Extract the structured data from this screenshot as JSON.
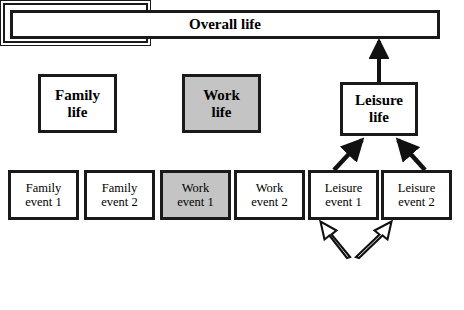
{
  "diagram": {
    "title_box": {
      "label": "Overall life"
    },
    "domains": [
      {
        "name": "family-life",
        "line1": "Family",
        "line2": "life",
        "shaded": false
      },
      {
        "name": "work-life",
        "line1": "Work",
        "line2": "life",
        "shaded": true
      },
      {
        "name": "leisure-life",
        "line1": "Leisure",
        "line2": "life",
        "shaded": false
      }
    ],
    "events": [
      {
        "name": "family-event-1",
        "line1": "Family",
        "line2": "event 1",
        "shaded": false
      },
      {
        "name": "family-event-2",
        "line1": "Family",
        "line2": "event 2",
        "shaded": false
      },
      {
        "name": "work-event-1",
        "line1": "Work",
        "line2": "event 1",
        "shaded": true
      },
      {
        "name": "work-event-2",
        "line1": "Work",
        "line2": "event 2",
        "shaded": false
      },
      {
        "name": "leisure-event-1",
        "line1": "Leisure",
        "line2": "event 1",
        "shaded": false
      },
      {
        "name": "leisure-event-2",
        "line1": "Leisure",
        "line2": "event 2",
        "shaded": false
      }
    ],
    "reevaluation_box": {
      "line1": "Re-evaluation based",
      "line2": "on social comparison"
    },
    "colors": {
      "stroke": "#1a1a1a",
      "shaded_fill": "#c4c4c4",
      "background": "#ffffff"
    }
  }
}
